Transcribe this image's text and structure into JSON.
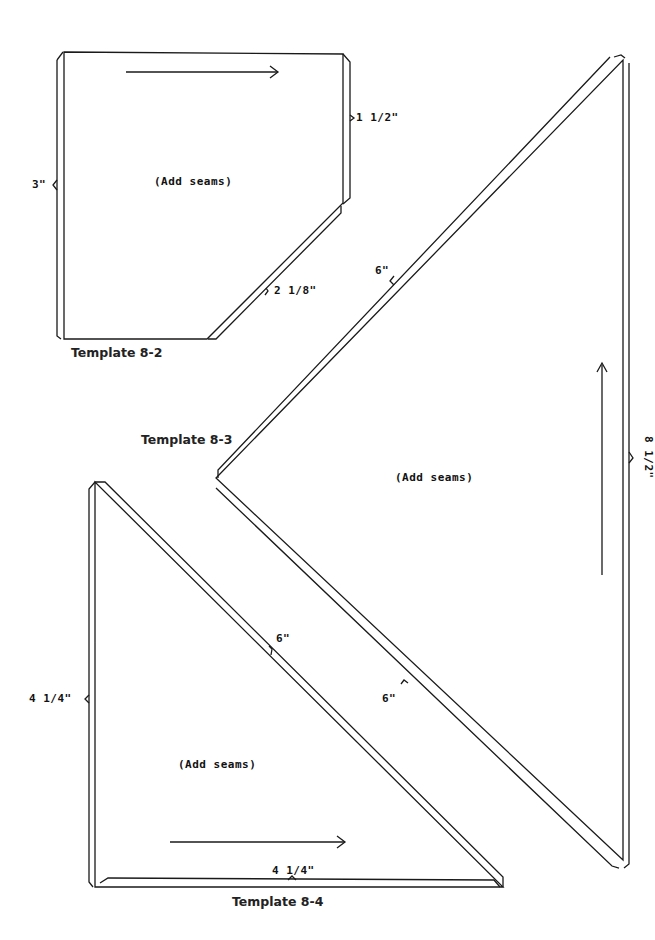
{
  "page": {
    "background": "#ffffff",
    "line_color": "#1a1a1a"
  },
  "templates": [
    {
      "id": "8-2",
      "title": "Template 8-2",
      "note": "(Add seams)",
      "dimensions": {
        "left": "3\"",
        "right": "1 1/2\"",
        "diagonal": "2 1/8\""
      },
      "grain_arrow": "right"
    },
    {
      "id": "8-3",
      "title": "Template 8-3",
      "note": "(Add seams)",
      "dimensions": {
        "upper_diagonal": "6\"",
        "lower_diagonal": "6\"",
        "right": "8 1/2\""
      },
      "grain_arrow": "up"
    },
    {
      "id": "8-4",
      "title": "Template 8-4",
      "note": "(Add seams)",
      "dimensions": {
        "left": "4 1/4\"",
        "hypotenuse": "6\"",
        "bottom": "4 1/4\""
      },
      "grain_arrow": "right"
    }
  ]
}
